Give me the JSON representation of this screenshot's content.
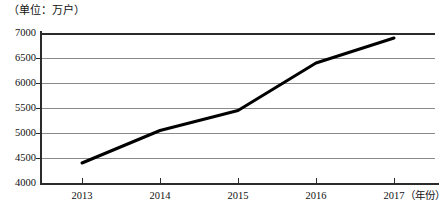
{
  "chart_data": {
    "type": "line",
    "title": "",
    "unit_label": "（单位：万户）",
    "xlabel": "（年份）",
    "ylabel": "",
    "categories": [
      "2013",
      "2014",
      "2015",
      "2016",
      "2017"
    ],
    "x": [
      2013,
      2014,
      2015,
      2016,
      2017
    ],
    "values": [
      4400,
      5050,
      5450,
      6400,
      6900
    ],
    "series": [
      {
        "name": "万户",
        "values": [
          4400,
          5050,
          5450,
          6400,
          6900
        ],
        "color": "#000000",
        "line_width": 3,
        "markers": false
      }
    ],
    "ylim": [
      4000,
      7000
    ],
    "ytick_step": 500,
    "yticks": [
      4000,
      4500,
      5000,
      5500,
      6000,
      6500,
      7000
    ],
    "ytick_labels": [
      "4000",
      "4500",
      "5000",
      "5500",
      "6000",
      "6500",
      "7000"
    ],
    "xticks": [
      "2013",
      "2014",
      "2015",
      "2016",
      "2017"
    ],
    "grid": true,
    "grid_color": "#8a8a8a",
    "axis_color": "#2b2b2b",
    "legend": false,
    "legend_position": "none",
    "background": "#ffffff"
  }
}
